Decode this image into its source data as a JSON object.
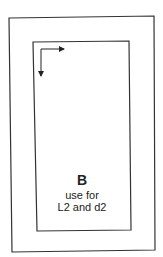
{
  "diagram": {
    "panel_label": "B",
    "description_line1": "use for",
    "description_line2": "L2 and d2",
    "colors": {
      "stroke": "#222222",
      "background": "#ffffff"
    }
  }
}
